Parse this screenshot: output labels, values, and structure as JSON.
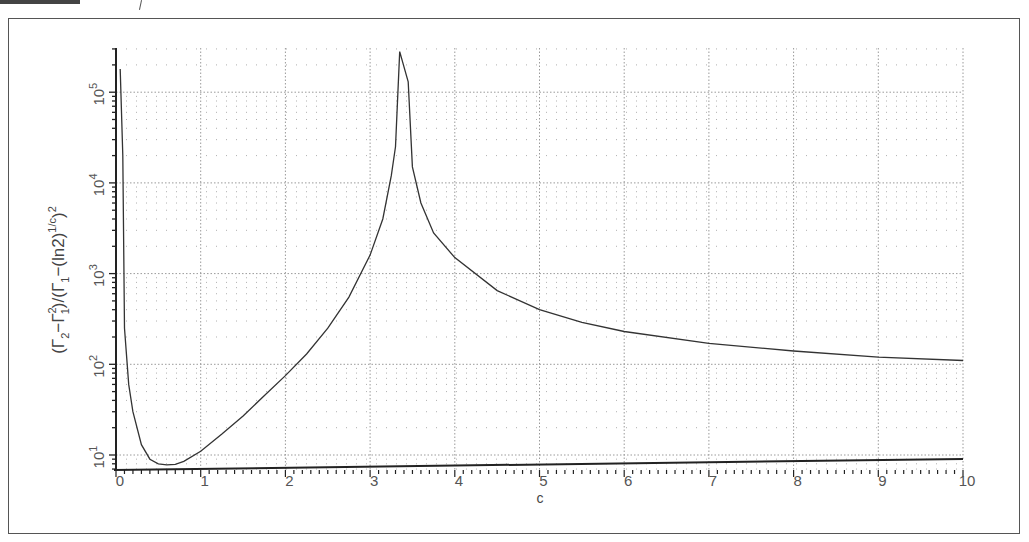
{
  "chart_data": {
    "type": "line",
    "title": "",
    "xlabel": "c",
    "ylabel": "(Γ2−Γ1²)/(Γ1−(ln2)^(1/c))²",
    "ylabel_parts": {
      "open": "(Γ",
      "s1": "2",
      "mid1": "−Γ",
      "s2": "1",
      "sup2": "2",
      "mid2": ")/(Γ",
      "s3": "1",
      "mid3": "−(ln2)",
      "sup1": "1/c",
      "close": ")",
      "sup3": "2"
    },
    "xscale": "linear",
    "yscale": "log",
    "xlim": [
      0,
      10
    ],
    "ylim": [
      7,
      300000
    ],
    "x_ticks": [
      "0",
      "1",
      "2",
      "3",
      "4",
      "5",
      "6",
      "7",
      "8",
      "9",
      "10"
    ],
    "y_ticks": [
      {
        "base": "10",
        "exp": "1",
        "value": 10
      },
      {
        "base": "10",
        "exp": "2",
        "value": 100
      },
      {
        "base": "10",
        "exp": "3",
        "value": 1000
      },
      {
        "base": "10",
        "exp": "4",
        "value": 10000
      },
      {
        "base": "10",
        "exp": "5",
        "value": 100000
      }
    ],
    "grid": true,
    "legend": null,
    "series": [
      {
        "name": "ratio",
        "x": [
          0.05,
          0.08,
          0.1,
          0.15,
          0.2,
          0.3,
          0.4,
          0.5,
          0.6,
          0.7,
          0.8,
          1.0,
          1.25,
          1.5,
          1.75,
          2.0,
          2.25,
          2.5,
          2.75,
          3.0,
          3.15,
          3.25,
          3.3,
          3.35,
          3.45,
          3.5,
          3.6,
          3.75,
          4.0,
          4.5,
          5.0,
          5.5,
          6.0,
          7.0,
          8.0,
          9.0,
          10.0
        ],
        "values": [
          180000,
          20000,
          250,
          60,
          30,
          13,
          9,
          8,
          7.8,
          7.9,
          8.5,
          11,
          17,
          27,
          45,
          75,
          130,
          250,
          550,
          1600,
          4000,
          12000,
          25000,
          280000,
          130000,
          15000,
          6000,
          2800,
          1500,
          650,
          400,
          290,
          230,
          170,
          140,
          120,
          110
        ]
      }
    ]
  },
  "colors": {
    "line": "#333333",
    "axis": "#222222",
    "grid": "#9a9a9a",
    "frame": "#555555"
  }
}
